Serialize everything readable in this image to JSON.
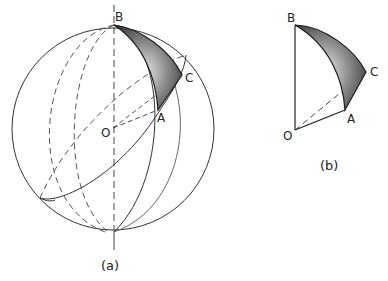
{
  "figure_a": {
    "caption": "(a)",
    "labels": {
      "B": "B",
      "C": "C",
      "A": "A",
      "O": "O"
    },
    "description": "Sphere with center O, showing spherical triangle ABC shaded on the surface"
  },
  "figure_b": {
    "caption": "(b)",
    "labels": {
      "B": "B",
      "C": "C",
      "A": "A",
      "O": "O"
    },
    "description": "Isolated solid sector O-ABC with shaded spherical triangle face"
  },
  "colors": {
    "line": "#333333",
    "dashed": "#555555",
    "shade_dark": "#2a2a2a",
    "shade_light": "#d8d8d8"
  }
}
